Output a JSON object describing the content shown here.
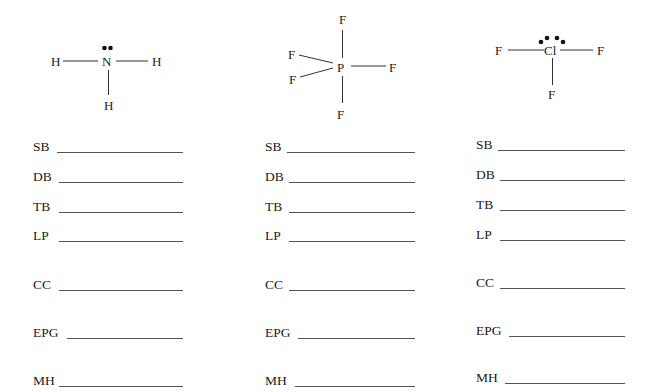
{
  "molecules": [
    {
      "name": "NH3",
      "central_atom": "N",
      "ligands": [
        "H",
        "H",
        "H"
      ],
      "lone_pair_dots": 2
    },
    {
      "name": "PF5",
      "central_atom": "P",
      "ligands": [
        "F",
        "F",
        "F",
        "F",
        "F"
      ],
      "lone_pair_dots": 0
    },
    {
      "name": "ClF3",
      "central_atom": "Cl",
      "ligands": [
        "F",
        "F",
        "F"
      ],
      "lone_pair_dots": 4
    }
  ],
  "fields": {
    "labels": [
      "SB",
      "DB",
      "TB",
      "LP",
      "CC",
      "EPG",
      "MH"
    ]
  },
  "columns": [
    {
      "fields": [
        {
          "label": "SB",
          "value": ""
        },
        {
          "label": "DB",
          "value": ""
        },
        {
          "label": "TB",
          "value": ""
        },
        {
          "label": "LP",
          "value": ""
        },
        {
          "label": "CC",
          "value": ""
        },
        {
          "label": "EPG",
          "value": ""
        },
        {
          "label": "MH",
          "value": ""
        }
      ]
    },
    {
      "fields": [
        {
          "label": "SB",
          "value": ""
        },
        {
          "label": "DB",
          "value": ""
        },
        {
          "label": "TB",
          "value": ""
        },
        {
          "label": "LP",
          "value": ""
        },
        {
          "label": "CC",
          "value": ""
        },
        {
          "label": "EPG",
          "value": ""
        },
        {
          "label": "MH",
          "value": ""
        }
      ]
    },
    {
      "fields": [
        {
          "label": "SB",
          "value": ""
        },
        {
          "label": "DB",
          "value": ""
        },
        {
          "label": "TB",
          "value": ""
        },
        {
          "label": "LP",
          "value": ""
        },
        {
          "label": "CC",
          "value": ""
        },
        {
          "label": "EPG",
          "value": ""
        },
        {
          "label": "MH",
          "value": ""
        }
      ]
    }
  ]
}
